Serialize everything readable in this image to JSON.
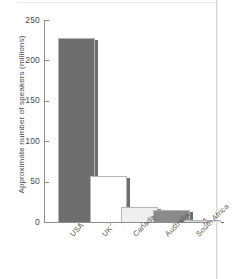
{
  "chart_data": {
    "type": "bar",
    "title": "",
    "xlabel": "",
    "ylabel": "Approximate number of speakers (millions)",
    "categories": [
      "USA",
      "UK",
      "Canada",
      "Australia",
      "South Africa"
    ],
    "values": [
      228,
      57,
      18,
      15,
      3
    ],
    "ylim": [
      0,
      250
    ],
    "yticks": [
      0,
      50,
      100,
      150,
      200,
      250
    ],
    "ytick_labels": [
      "0",
      "50",
      "100",
      "150",
      "200",
      "250"
    ],
    "grid": false,
    "legend": "none",
    "bar_colors": [
      "#6e6e6e",
      "#ffffff",
      "#efefef",
      "#8a8a8a",
      "#d9d9d9"
    ],
    "bar_shadow_color": "#6e6e6e",
    "axis_color": "#8d8d8d",
    "text_color": "#4a4a4a"
  },
  "axis": {
    "y_title": "Approximate number of speakers (millions)"
  }
}
